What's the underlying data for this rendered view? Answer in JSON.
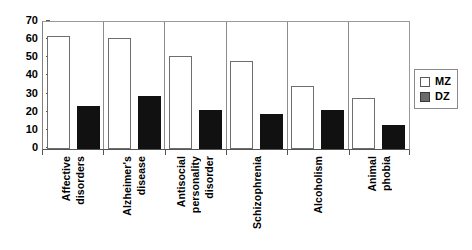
{
  "chart_data": {
    "type": "bar",
    "title": "",
    "xlabel": "",
    "ylabel": "",
    "ylim": [
      0,
      70
    ],
    "y_ticks": [
      0,
      10,
      20,
      30,
      40,
      50,
      60,
      70
    ],
    "grid": false,
    "legend_position": "right",
    "categories": [
      "Affective disorders",
      "Alzheimer's disease",
      "Antisocial personality disorder",
      "Schizophrenia",
      "Alcoholism",
      "Animal phobia"
    ],
    "category_label_lines": [
      [
        "Affective",
        "disorders"
      ],
      [
        "Alzheimer's",
        "disease"
      ],
      [
        "Antisocial",
        "personality",
        "disorder"
      ],
      [
        "Schizophrenia"
      ],
      [
        "Alcoholism"
      ],
      [
        "Animal",
        "phobia"
      ]
    ],
    "series": [
      {
        "name": "MZ",
        "color": "#ffffff",
        "values": [
          62,
          60.5,
          51,
          48,
          34.5,
          28
        ]
      },
      {
        "name": "DZ",
        "color": "#111111",
        "values": [
          23.5,
          29,
          21.5,
          19,
          21.5,
          13
        ]
      }
    ]
  },
  "axis": {
    "y_tick_labels": [
      "70",
      "60",
      "50",
      "40",
      "30",
      "20",
      "10",
      "0"
    ]
  },
  "legend": {
    "items": [
      {
        "label": "MZ",
        "swatch": "white-square-icon"
      },
      {
        "label": "DZ",
        "swatch": "dark-square-icon"
      }
    ]
  }
}
